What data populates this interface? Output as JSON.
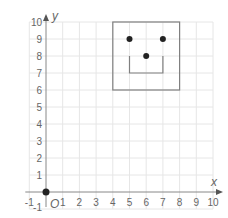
{
  "diagram": {
    "type": "coordinate-grid",
    "axes": {
      "x_label": "x",
      "y_label": "y",
      "origin_label": "O",
      "x_ticks": [
        "-1",
        "1",
        "2",
        "3",
        "4",
        "5",
        "6",
        "7",
        "8",
        "9",
        "10"
      ],
      "y_ticks": [
        "-1",
        "1",
        "2",
        "3",
        "4",
        "5",
        "6",
        "7",
        "8",
        "9",
        "10"
      ],
      "x_range": [
        -1,
        10
      ],
      "y_range": [
        -1,
        10
      ]
    },
    "shapes": {
      "square": {
        "x1": 4,
        "y1": 6,
        "x2": 8,
        "y2": 10
      },
      "mouth": [
        [
          5,
          8
        ],
        [
          5,
          7
        ],
        [
          7,
          7
        ],
        [
          7,
          8
        ]
      ],
      "points": [
        {
          "name": "left-eye",
          "x": 5,
          "y": 9
        },
        {
          "name": "right-eye",
          "x": 7,
          "y": 9
        },
        {
          "name": "nose",
          "x": 6,
          "y": 8
        },
        {
          "name": "origin",
          "x": 0,
          "y": 0
        }
      ]
    },
    "colors": {
      "grid": "#e6e6e6",
      "axis": "#888888",
      "shape": "#808080",
      "point": "#222222",
      "text": "#666666"
    }
  }
}
